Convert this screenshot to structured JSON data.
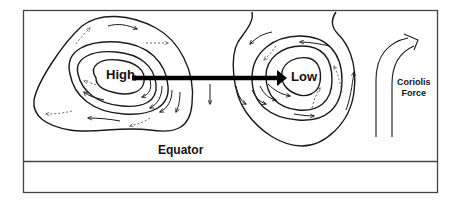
{
  "labels": {
    "high": "High",
    "low": "Low",
    "equator": "Equator",
    "coriolis_line1": "Coriolis",
    "coriolis_line2": "Force"
  },
  "colors": {
    "line": "#1a1a1a",
    "dashed": "#555555",
    "background": "#ffffff"
  },
  "elements": {
    "high_pressure_system": "clockwise isobar rings with outward dashed arrows",
    "low_pressure_system": "counter-clockwise isobar rings with inward dashed arrows",
    "pressure_gradient_arrow": "thick arrow from High to Low",
    "coriolis_arrow": "upward arrow curving right"
  }
}
